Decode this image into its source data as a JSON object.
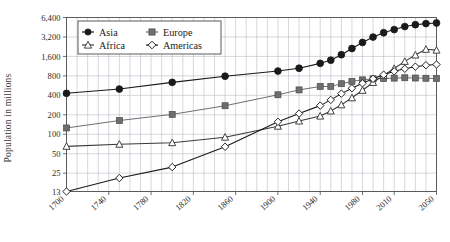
{
  "chart_data": {
    "type": "line",
    "title": "",
    "xlabel": "",
    "ylabel": "Population in millions",
    "yscale": "log",
    "ylim": [
      13,
      6400
    ],
    "xlim": [
      1700,
      2050
    ],
    "grid": true,
    "legend_position": "top-left",
    "ytick_labels": [
      "13",
      "25",
      "50",
      "100",
      "200",
      "400",
      "800",
      "1,600",
      "3,200",
      "6,400"
    ],
    "ytick_values": [
      13,
      25,
      50,
      100,
      200,
      400,
      800,
      1600,
      3200,
      6400
    ],
    "xtick_labels": [
      "1700",
      "1740",
      "1780",
      "1820",
      "1860",
      "1900",
      "1940",
      "1980",
      "2010",
      "2050"
    ],
    "xtick_values": [
      1700,
      1740,
      1780,
      1820,
      1860,
      1900,
      1940,
      1980,
      2010,
      2050
    ],
    "series": [
      {
        "name": "Asia",
        "marker": "filled-circle",
        "color": "#1a1a1a",
        "x": [
          1700,
          1750,
          1800,
          1850,
          1900,
          1920,
          1940,
          1950,
          1960,
          1970,
          1980,
          1990,
          2000,
          2010,
          2020,
          2030,
          2040,
          2050
        ],
        "values": [
          430,
          500,
          635,
          790,
          950,
          1050,
          1250,
          1400,
          1700,
          2120,
          2630,
          3190,
          3720,
          4160,
          4640,
          4950,
          5150,
          5260
        ]
      },
      {
        "name": "Europe",
        "marker": "filled-square",
        "color": "#6e6e6e",
        "x": [
          1700,
          1750,
          1800,
          1850,
          1900,
          1920,
          1940,
          1950,
          1960,
          1970,
          1980,
          1990,
          2000,
          2010,
          2020,
          2030,
          2040,
          2050
        ],
        "values": [
          125,
          163,
          203,
          276,
          408,
          485,
          549,
          549,
          605,
          657,
          694,
          721,
          727,
          738,
          748,
          741,
          735,
          728
        ]
      },
      {
        "name": "Africa",
        "marker": "open-triangle",
        "color": "#3a3a3a",
        "x": [
          1700,
          1750,
          1800,
          1850,
          1900,
          1920,
          1940,
          1950,
          1960,
          1970,
          1980,
          1990,
          2000,
          2010,
          2020,
          2030,
          2040,
          2050
        ],
        "values": [
          65,
          70,
          74,
          90,
          133,
          160,
          191,
          229,
          285,
          366,
          478,
          632,
          814,
          1040,
          1340,
          1680,
          2060,
          2000
        ]
      },
      {
        "name": "Americas",
        "marker": "open-diamond",
        "color": "#1a1a1a",
        "x": [
          1700,
          1750,
          1800,
          1850,
          1900,
          1920,
          1940,
          1950,
          1960,
          1970,
          1980,
          1990,
          2000,
          2010,
          2020,
          2030,
          2040,
          2050
        ],
        "values": [
          13,
          21,
          31,
          64,
          156,
          209,
          277,
          340,
          425,
          515,
          613,
          720,
          836,
          940,
          1030,
          1110,
          1170,
          1200
        ]
      }
    ]
  },
  "legend": {
    "items": [
      {
        "label": "Asia"
      },
      {
        "label": "Europe"
      },
      {
        "label": "Africa"
      },
      {
        "label": "Americas"
      }
    ]
  }
}
